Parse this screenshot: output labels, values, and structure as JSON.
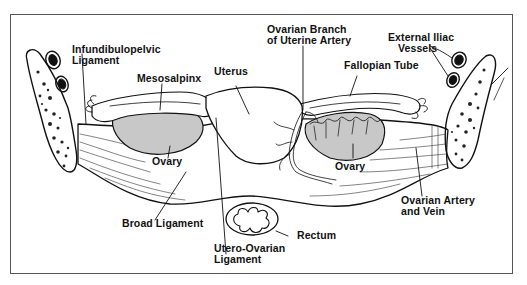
{
  "diagram": {
    "title": "",
    "colors": {
      "line": "#111111",
      "ovary_fill": "#c8c8c8",
      "frame": "#555555",
      "background": "#ffffff"
    },
    "labels": {
      "infundibulopelvic": [
        "Infundibulopelvic",
        "Ligament"
      ],
      "mesosalpinx": [
        "Mesosalpinx"
      ],
      "uterus": [
        "Uterus"
      ],
      "ovarian_branch": [
        "Ovarian Branch",
        "of Uterine Artery"
      ],
      "fallopian_tube": [
        "Fallopian Tube"
      ],
      "external_iliac": [
        "External Iliac",
        "Vessels"
      ],
      "ovary_left": [
        "Ovary"
      ],
      "ovary_right": [
        "Ovary"
      ],
      "broad_ligament": [
        "Broad Ligament"
      ],
      "utero_ovarian": [
        "Utero-Ovarian",
        "Ligament"
      ],
      "rectum": [
        "Rectum"
      ],
      "ovarian_artery_vein": [
        "Ovarian Artery",
        "and Vein"
      ]
    }
  }
}
